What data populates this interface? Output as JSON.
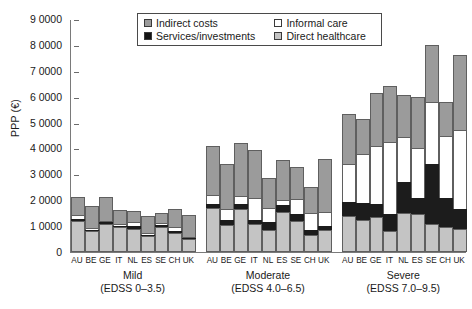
{
  "chart_data": {
    "type": "bar",
    "subtype": "stacked-bar-grouped",
    "title": "",
    "xlabel": "",
    "ylabel": "PPP (€)",
    "ylim": [
      0,
      90000
    ],
    "ytick_values": [
      0,
      10000,
      20000,
      30000,
      40000,
      50000,
      60000,
      70000,
      80000,
      90000
    ],
    "ytick_labels": [
      "0",
      "1 0000",
      "2 0000",
      "3 0000",
      "4 0000",
      "5 0000",
      "6 0000",
      "7 0000",
      "8 0000",
      "9 0000"
    ],
    "grid": false,
    "legend_position": "top-center",
    "stack_order_bottom_to_top": [
      "Direct healthcare",
      "Services/investments",
      "Informal care",
      "Indirect costs"
    ],
    "legend": [
      {
        "label": "Indirect costs",
        "color": "#9b9b9b"
      },
      {
        "label": "Informal care",
        "color": "#ffffff"
      },
      {
        "label": "Services/investments",
        "color": "#141414"
      },
      {
        "label": "Direct healthcare",
        "color": "#c4c4c4"
      }
    ],
    "categories": [
      "AU",
      "BE",
      "GE",
      "IT",
      "NL",
      "ES",
      "SE",
      "CH",
      "UK"
    ],
    "groups": [
      {
        "name": "Mild",
        "sublabel": "(EDSS 0–3.5)",
        "series": [
          {
            "name": "Direct healthcare",
            "values": [
              12000,
              8000,
              11000,
              9500,
              9000,
              6000,
              9500,
              7500,
              5000
            ]
          },
          {
            "name": "Services/investments",
            "values": [
              700,
              600,
              500,
              700,
              1200,
              500,
              900,
              600,
              400
            ]
          },
          {
            "name": "Informal care",
            "values": [
              1500,
              700,
              600,
              600,
              1300,
              900,
              1000,
              1400,
              500
            ]
          },
          {
            "name": "Indirect costs",
            "values": [
              7000,
              8500,
              9000,
              5500,
              4500,
              6500,
              3500,
              7000,
              8500
            ]
          }
        ],
        "totals": [
          21200,
          17800,
          21100,
          16300,
          16000,
          13900,
          14900,
          16500,
          14400
        ]
      },
      {
        "name": "Moderate",
        "sublabel": "(EDSS 4.0–6.5)",
        "series": [
          {
            "name": "Direct healthcare",
            "values": [
              17000,
              10500,
              16500,
              11000,
              8500,
              15500,
              12000,
              6500,
              8500
            ]
          },
          {
            "name": "Services/investments",
            "values": [
              1500,
              2000,
              2000,
              1500,
              3000,
              2500,
              2500,
              2000,
              1500
            ]
          },
          {
            "name": "Informal care",
            "values": [
              3500,
              4000,
              3000,
              8500,
              5500,
              2000,
              6000,
              6500,
              5500
            ]
          },
          {
            "name": "Indirect costs",
            "values": [
              19000,
              17500,
              20500,
              18500,
              11500,
              15500,
              12500,
              10000,
              20500
            ]
          }
        ],
        "totals": [
          41000,
          34000,
          42000,
          39500,
          28500,
          35500,
          33000,
          25000,
          36000
        ]
      },
      {
        "name": "Severe",
        "sublabel": "(EDSS 7.0–9.5)",
        "series": [
          {
            "name": "Direct healthcare",
            "values": [
              14000,
              12500,
              13500,
              8000,
              15000,
              14500,
              11000,
              9500,
              9000
            ]
          },
          {
            "name": "Services/investments",
            "values": [
              5500,
              6500,
              5000,
              6500,
              12000,
              6500,
              23000,
              11500,
              7500
            ]
          },
          {
            "name": "Informal care",
            "values": [
              14500,
              19000,
              22500,
              28000,
              17500,
              19000,
              24000,
              24000,
              30500
            ]
          },
          {
            "name": "Indirect costs",
            "values": [
              19500,
              13500,
              20500,
              21500,
              16000,
              20000,
              22000,
              13000,
              29000
            ]
          }
        ],
        "totals": [
          53500,
          51500,
          61500,
          64000,
          60500,
          60000,
          80000,
          58000,
          76000
        ]
      }
    ]
  }
}
